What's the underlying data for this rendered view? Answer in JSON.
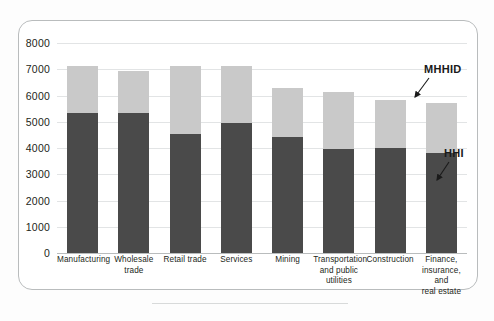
{
  "chart_data": {
    "type": "bar",
    "stacked": true,
    "title": "",
    "subtitle": "",
    "xlabel": "",
    "ylabel": "",
    "ylim": [
      0,
      8000
    ],
    "ytick_step": 1000,
    "yticks": [
      "8000",
      "7000",
      "6000",
      "5000",
      "4000",
      "3000",
      "2000",
      "1000",
      "0"
    ],
    "grid": true,
    "legend_position": "annotation-arrows",
    "categories": [
      "Manufacturing",
      "Wholesale trade",
      "Retail trade",
      "Services",
      "Mining",
      "Transportation and public utilities",
      "Construction",
      "Finance, insurance, and real estate"
    ],
    "category_label_lines": [
      [
        "Manufacturing"
      ],
      [
        "Wholesale",
        "trade"
      ],
      [
        "Retail trade"
      ],
      [
        "Services"
      ],
      [
        "Mining"
      ],
      [
        "Transportation",
        "and public",
        "utilities"
      ],
      [
        "Construction"
      ],
      [
        "Finance,",
        "insurance, and",
        "real estate"
      ]
    ],
    "series": [
      {
        "name": "HHI",
        "color": "#4a4a4a",
        "values": [
          5350,
          5350,
          4550,
          4950,
          4430,
          3970,
          4000,
          3820
        ]
      },
      {
        "name": "MHHID",
        "color": "#c9c9c9",
        "values": [
          1780,
          1600,
          2580,
          2180,
          1840,
          2180,
          1820,
          1910
        ]
      }
    ],
    "totals": [
      7130,
      6950,
      7130,
      7130,
      6270,
      6150,
      5820,
      5730
    ],
    "annotations": [
      {
        "name": "MHHID",
        "label": "MHHID",
        "points_to": "upper-light-segment"
      },
      {
        "name": "HHI",
        "label": "HHI",
        "points_to": "lower-dark-segment"
      }
    ]
  },
  "colors": {
    "series_hhi": "#4a4a4a",
    "series_mhhid": "#c9c9c9",
    "gridline": "#e2e4e5",
    "axis": "#b9bcbd",
    "frame": "#b9bcbd",
    "text": "#231f20"
  }
}
